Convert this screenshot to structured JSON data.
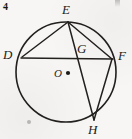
{
  "figure": {
    "problem_number": "4",
    "shape": "circle-with-inscribed-chords",
    "stroke_color": "#23201e",
    "background_color": "#f7f6f4",
    "circle": {
      "cx": 66,
      "cy": 72,
      "r": 50
    },
    "points": [
      {
        "id": "E",
        "label": "E",
        "x": 68,
        "y": 22,
        "label_x": 62,
        "label_y": 4,
        "on_circle": true
      },
      {
        "id": "D",
        "label": "D",
        "x": 22,
        "y": 57,
        "label_x": 4,
        "label_y": 50,
        "on_circle": true
      },
      {
        "id": "F",
        "label": "F",
        "x": 112,
        "y": 59,
        "label_x": 118,
        "label_y": 51,
        "on_circle": true
      },
      {
        "id": "G",
        "label": "G",
        "x": 76,
        "y": 55,
        "label_x": 78,
        "label_y": 44,
        "on_circle": false
      },
      {
        "id": "H",
        "label": "H",
        "x": 94,
        "y": 120,
        "label_x": 90,
        "label_y": 124,
        "on_circle": true
      },
      {
        "id": "O",
        "label": "O",
        "x": 68,
        "y": 73,
        "label_x": 55,
        "label_y": 70,
        "on_circle": false
      }
    ],
    "segments": [
      {
        "from": "D",
        "to": "E",
        "name": "segment-DE"
      },
      {
        "from": "E",
        "to": "F",
        "name": "segment-EF"
      },
      {
        "from": "E",
        "to": "H",
        "name": "segment-EH"
      },
      {
        "from": "D",
        "to": "F",
        "name": "segment-DF"
      },
      {
        "from": "F",
        "to": "H",
        "name": "segment-FH"
      }
    ],
    "center_dot": {
      "x": 68,
      "y": 73,
      "r": 2.1
    }
  }
}
